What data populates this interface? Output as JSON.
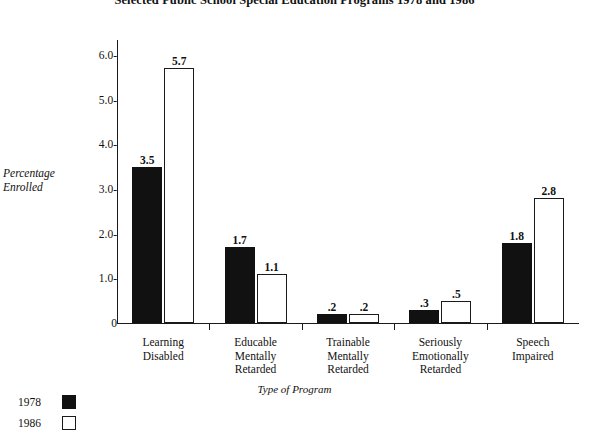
{
  "chart_data": {
    "type": "bar",
    "title": "Selected Public School Special Education Programs 1978 and 1986",
    "xlabel": "Type of Program",
    "ylabel": "Percentage Enrolled",
    "ylabel_line1": "Percentage",
    "ylabel_line2": "Enrolled",
    "ylim": [
      0,
      6.3
    ],
    "grid": false,
    "legend_position": "bottom-left",
    "categories": [
      "Learning Disabled",
      "Educable Mentally Retarded",
      "Trainable Mentally Retarded",
      "Seriously Emotionally Retarded",
      "Speech Impaired"
    ],
    "category_lines": [
      [
        "Learning",
        "Disabled"
      ],
      [
        "Educable",
        "Mentally",
        "Retarded"
      ],
      [
        "Trainable",
        "Mentally",
        "Retarded"
      ],
      [
        "Seriously",
        "Emotionally",
        "Retarded"
      ],
      [
        "Speech",
        "Impaired"
      ]
    ],
    "series": [
      {
        "name": "1978",
        "color": "#111111",
        "values": [
          3.5,
          1.7,
          0.2,
          0.3,
          1.8
        ],
        "labels": [
          "3.5",
          "1.7",
          ".2",
          ".3",
          "1.8"
        ]
      },
      {
        "name": "1986",
        "color": "#ffffff",
        "values": [
          5.7,
          1.1,
          0.2,
          0.5,
          2.8
        ],
        "labels": [
          "5.7",
          "1.1",
          ".2",
          ".5",
          "2.8"
        ]
      }
    ],
    "ytick_labels": [
      "6.0-",
      "5.0-",
      "4.0-",
      "3.0-",
      "2.0-",
      "1.0-",
      "0"
    ],
    "ytick_values": [
      6.0,
      5.0,
      4.0,
      3.0,
      2.0,
      1.0,
      0
    ]
  },
  "legend": {
    "entries": [
      {
        "label": "1978",
        "swatch": "filled-black-square"
      },
      {
        "label": "1986",
        "swatch": "outlined-white-square"
      }
    ]
  }
}
